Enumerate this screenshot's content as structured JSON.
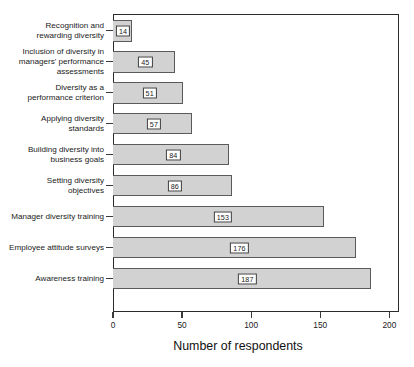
{
  "chart_data": {
    "type": "bar",
    "orientation": "horizontal",
    "title": "",
    "xlabel": "Number of respondents",
    "ylabel": "",
    "xlim": [
      0,
      207
    ],
    "xticks": [
      0,
      50,
      100,
      150,
      200
    ],
    "grid": false,
    "legend": false,
    "bar_color": "#d2d2d2",
    "bar_edge_color": "#5a5a5a",
    "categories": [
      "Recognition and\nrewarding diversity",
      "Inclusion of diversity in\nmanagers' performance\nassessments",
      "Diversity as a\nperformance criterion",
      "Applying diversity\nstandards",
      "Building diversity into\nbusiness goals",
      "Setting diversity\nobjectives",
      "Manager diversity training",
      "Employee attitude surveys",
      "Awareness training"
    ],
    "values": [
      14,
      45,
      51,
      57,
      84,
      86,
      153,
      176,
      187
    ],
    "value_labels": [
      "14",
      "45",
      "51",
      "57",
      "84",
      "86",
      "153",
      "176",
      "187"
    ],
    "xtick_labels": [
      "0",
      "50",
      "100",
      "150",
      "200"
    ]
  }
}
